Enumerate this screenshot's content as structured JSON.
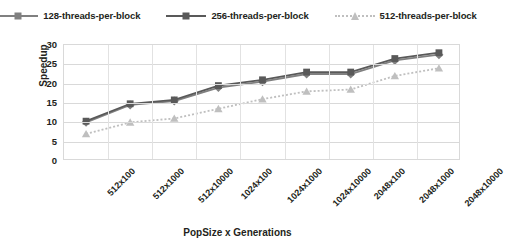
{
  "chart_data": {
    "type": "line",
    "title": "",
    "xlabel": "PopSize x Generations",
    "ylabel": "Speedup",
    "ylim": [
      0,
      30
    ],
    "ytick_step": 5,
    "yticks": [
      30,
      25,
      20,
      15,
      10,
      5,
      0
    ],
    "grid": true,
    "legend_position": "top",
    "categories": [
      "512x100",
      "512x1000",
      "512x10000",
      "1024x100",
      "1024x1000",
      "1024x10000",
      "2048x100",
      "2048x1000",
      "2048x10000"
    ],
    "series": [
      {
        "name": "128-threads-per-block",
        "color": "#808080",
        "marker": "diamond",
        "dash": "solid",
        "values": [
          10.0,
          14.5,
          15.5,
          19.0,
          20.5,
          22.5,
          22.5,
          26.0,
          27.5
        ]
      },
      {
        "name": "256-threads-per-block",
        "color": "#595959",
        "marker": "square",
        "dash": "solid",
        "values": [
          10.3,
          14.8,
          15.8,
          19.5,
          21.0,
          23.0,
          23.0,
          26.5,
          28.0
        ]
      },
      {
        "name": "512-threads-per-block",
        "color": "#bfbfbf",
        "marker": "triangle",
        "dash": "dotted",
        "values": [
          7.0,
          10.0,
          11.0,
          13.5,
          16.0,
          18.0,
          18.5,
          22.0,
          24.0
        ]
      }
    ]
  }
}
